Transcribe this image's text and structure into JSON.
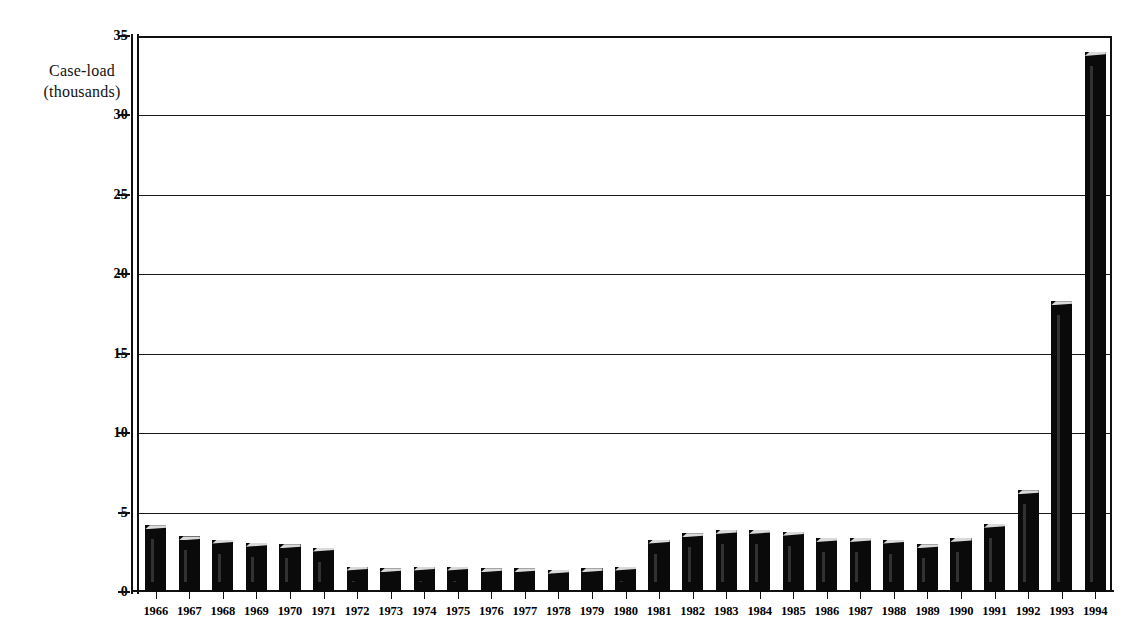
{
  "chart_data": {
    "type": "bar",
    "title": "",
    "subtitle": "",
    "xlabel": "",
    "ylabel": "Case-load\n(thousands)",
    "ylabel_line1": "Case-load",
    "ylabel_line2": "(thousands)",
    "ylim": [
      0,
      35
    ],
    "yticks": [
      0,
      5,
      10,
      15,
      20,
      25,
      30,
      35
    ],
    "ytick_labels": [
      "0",
      "5",
      "10",
      "15",
      "20",
      "25",
      "30",
      "35"
    ],
    "grid": true,
    "grid_axis": "y",
    "legend": null,
    "legend_position": "none",
    "bar_color": "#0a0a0a",
    "background_color": "#ffffff",
    "categories": [
      "1966",
      "1967",
      "1968",
      "1969",
      "1970",
      "1971",
      "1972",
      "1973",
      "1974",
      "1975",
      "1976",
      "1977",
      "1978",
      "1979",
      "1980",
      "1981",
      "1982",
      "1983",
      "1984",
      "1985",
      "1986",
      "1987",
      "1988",
      "1989",
      "1990",
      "1991",
      "1992",
      "1993",
      "1994"
    ],
    "values": [
      4.2,
      3.5,
      3.3,
      3.1,
      3.0,
      2.8,
      1.6,
      1.5,
      1.6,
      1.6,
      1.5,
      1.5,
      1.4,
      1.5,
      1.6,
      3.3,
      3.7,
      3.9,
      3.9,
      3.8,
      3.4,
      3.4,
      3.3,
      3.0,
      3.4,
      4.3,
      6.4,
      18.3,
      34.0
    ]
  }
}
